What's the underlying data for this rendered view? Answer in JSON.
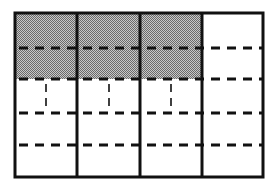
{
  "diagram": {
    "type": "fraction-grid",
    "columns": 4,
    "rows": 5,
    "frame": {
      "x": 15,
      "y": 13,
      "width": 248,
      "height": 164
    },
    "column_edges": [
      15,
      77,
      140,
      202,
      263
    ],
    "row_edges": [
      13,
      48,
      79,
      113,
      145,
      177
    ],
    "shaded_cells": [
      {
        "col": 0,
        "row": 0
      },
      {
        "col": 1,
        "row": 0
      },
      {
        "col": 2,
        "row": 0
      },
      {
        "col": 0,
        "row": 1
      },
      {
        "col": 1,
        "row": 1
      },
      {
        "col": 2,
        "row": 1
      }
    ],
    "row3_vertical_dashes_x": [
      46,
      109,
      171
    ],
    "colors": {
      "line": "#111111",
      "shade_dark": "#6a6a6a",
      "shade_light": "#c8c8c8",
      "background": "#ffffff"
    }
  }
}
